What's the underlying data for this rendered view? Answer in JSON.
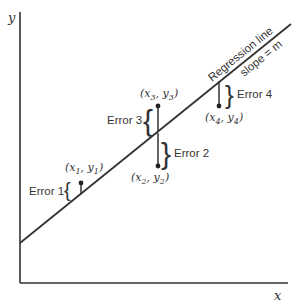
{
  "axes": {
    "x_label": "x",
    "y_label": "y"
  },
  "regression": {
    "label": "Regression line",
    "slope_label": "slope = m"
  },
  "points": [
    {
      "label": "(x1, y1)",
      "sub": "1",
      "error_label": "Error 1"
    },
    {
      "label": "(x2, y2)",
      "sub": "2",
      "error_label": "Error 2"
    },
    {
      "label": "(x3, y3)",
      "sub": "3",
      "error_label": "Error 3"
    },
    {
      "label": "(x4, y4)",
      "sub": "4",
      "error_label": "Error 4"
    }
  ],
  "colors": {
    "line": "#333333",
    "background": "#ffffff"
  }
}
